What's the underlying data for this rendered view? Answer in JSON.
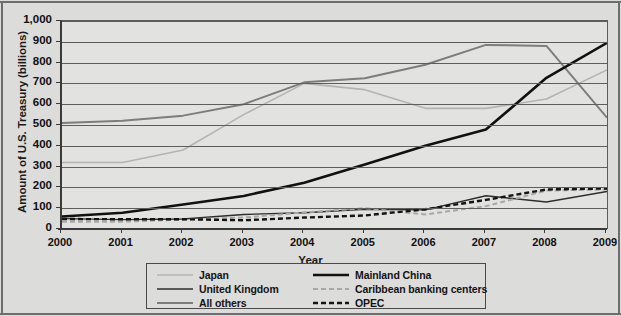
{
  "chart_data": {
    "type": "line",
    "title": "",
    "xlabel": "Year",
    "ylabel": "Amount of U.S. Treasury (billions)",
    "categories": [
      "2000",
      "2001",
      "2002",
      "2003",
      "2004",
      "2005",
      "2006",
      "2007",
      "2008",
      "2009"
    ],
    "x": [
      2000,
      2001,
      2002,
      2003,
      2004,
      2005,
      2006,
      2007,
      2008,
      2009
    ],
    "xlim": [
      2000,
      2009
    ],
    "ylim": [
      0,
      1000
    ],
    "ytick_labels": [
      "1,000",
      "900",
      "800",
      "700",
      "600",
      "500",
      "400",
      "300",
      "200",
      "100",
      "0"
    ],
    "ytick_values": [
      1000,
      900,
      800,
      700,
      600,
      500,
      400,
      300,
      200,
      100,
      0
    ],
    "grid": true,
    "legend_position": "below-center",
    "series": [
      {
        "name": "Japan",
        "color": "#b4b4b2",
        "style": "solid",
        "width": 1.6,
        "values": [
          320,
          320,
          380,
          550,
          700,
          670,
          580,
          580,
          625,
          765
        ]
      },
      {
        "name": "United Kingdom",
        "color": "#2e2e2e",
        "style": "solid",
        "width": 1.4,
        "values": [
          50,
          45,
          48,
          70,
          78,
          95,
          92,
          160,
          130,
          180
        ]
      },
      {
        "name": "All others",
        "color": "#7d7d7b",
        "style": "solid",
        "width": 2.0,
        "values": [
          510,
          520,
          545,
          600,
          705,
          725,
          790,
          885,
          880,
          535
        ]
      },
      {
        "name": "Mainland China",
        "color": "#111111",
        "style": "solid",
        "width": 2.6,
        "values": [
          60,
          78,
          118,
          159,
          222,
          310,
          400,
          478,
          727,
          895
        ]
      },
      {
        "name": "Caribbean banking centers",
        "color": "#a8a8a6",
        "style": "dashed",
        "width": 2.0,
        "values": [
          35,
          35,
          45,
          55,
          80,
          100,
          70,
          110,
          185,
          190
        ]
      },
      {
        "name": "OPEC",
        "color": "#141414",
        "style": "dashed",
        "width": 2.4,
        "values": [
          48,
          47,
          47,
          42,
          55,
          65,
          95,
          140,
          190,
          195
        ]
      }
    ]
  },
  "legend": {
    "columns": [
      [
        {
          "label": "Japan",
          "series_index": 0
        },
        {
          "label": "United Kingdom",
          "series_index": 1
        },
        {
          "label": "All others",
          "series_index": 2
        }
      ],
      [
        {
          "label": "Mainland China",
          "series_index": 3
        },
        {
          "label": "Caribbean banking centers",
          "series_index": 4
        },
        {
          "label": "OPEC",
          "series_index": 5
        }
      ]
    ]
  }
}
